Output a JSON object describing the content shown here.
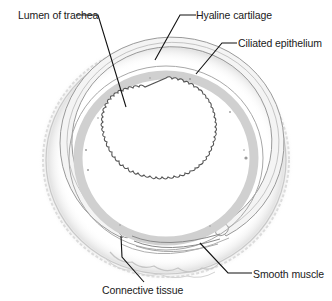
{
  "diagram": {
    "labels": {
      "lumen": "Lumen of trachea",
      "hyaline_cartilage": "Hyaline cartilage",
      "ciliated_epithelium": "Ciliated epithelium",
      "smooth_muscle": "Smooth muscle",
      "connective_tissue": "Connective tissue"
    },
    "colors": {
      "background": "#ffffff",
      "outline": "#8a8a8a",
      "tissue_fill": "#e6e6e6",
      "cartilage_fill": "#f4f4f4",
      "leader_line": "#111111",
      "text": "#1a1a1a"
    }
  }
}
